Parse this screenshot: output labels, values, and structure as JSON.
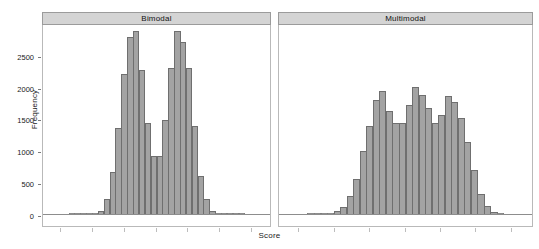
{
  "chart_data": {
    "type": "bar",
    "title": "",
    "xlabel": "Score",
    "ylabel": "Frequency",
    "ylim": [
      0,
      2950
    ],
    "grid": false,
    "legend": null,
    "facets": [
      {
        "strip_label": "Bimodal",
        "bin_count": 30,
        "values": [
          5,
          8,
          12,
          20,
          35,
          70,
          250,
          670,
          1370,
          2210,
          2800,
          2880,
          2270,
          1450,
          920,
          920,
          1490,
          2310,
          2880,
          2720,
          2310,
          1400,
          620,
          255,
          70,
          25,
          12,
          8,
          5,
          3
        ]
      },
      {
        "strip_label": "Multimodal",
        "bin_count": 30,
        "values": [
          5,
          10,
          18,
          30,
          60,
          130,
          300,
          560,
          1000,
          1400,
          1800,
          1950,
          1640,
          1450,
          1440,
          1720,
          2010,
          1880,
          1680,
          1440,
          1570,
          1860,
          1780,
          1520,
          1150,
          700,
          330,
          140,
          55,
          20
        ]
      }
    ],
    "y_ticks": [
      0,
      500,
      1000,
      1500,
      2000,
      2500
    ],
    "y_tick_labels": [
      "0",
      "500",
      "1000",
      "1500",
      "2000",
      "2500"
    ],
    "x_tick_count_per_panel": 7,
    "x_tick_labels": [],
    "colors": {
      "bar_fill": "#a3a3a3",
      "bar_border": "#6f6f6f",
      "strip_background": "#d4d4d4",
      "strip_border": "#9b9b9b",
      "panel_border": "#b9b9b9",
      "axis": "#8d8d8d",
      "text": "#1a1a1a",
      "background": "#ffffff"
    }
  },
  "layout": {
    "panel_top": 12,
    "strip_height": 13,
    "body_height": 202,
    "left_panel": {
      "x": 42,
      "width": 229
    },
    "right_panel": {
      "x": 278,
      "width": 255
    }
  }
}
